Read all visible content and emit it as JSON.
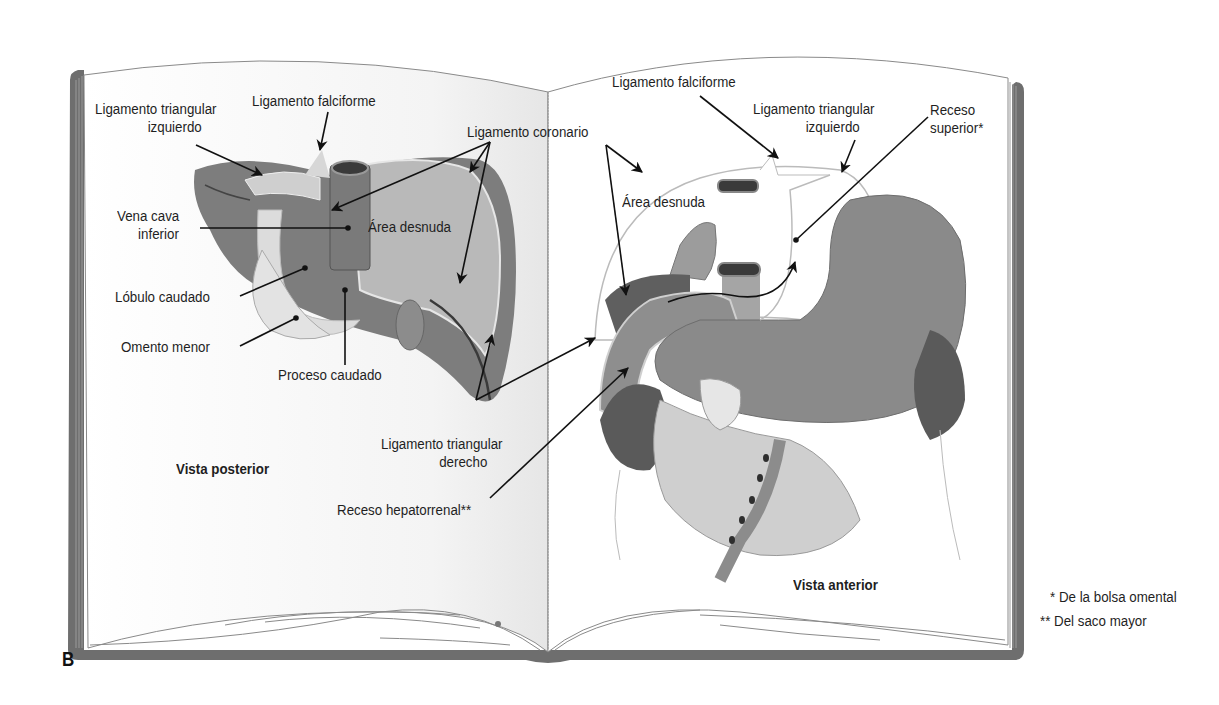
{
  "figure": {
    "panel_letter": "B",
    "left_page": {
      "view_title": "Vista posterior",
      "labels": {
        "ligamento_triangular_izquierdo_1": "Ligamento triangular",
        "ligamento_triangular_izquierdo_2": "izquierdo",
        "ligamento_falciforme": "Ligamento falciforme",
        "ligamento_coronario": "Ligamento coronario",
        "vena_cava_1": "Vena cava",
        "vena_cava_2": "inferior",
        "area_desnuda": "Área desnuda",
        "lobulo_caudado": "Lóbulo caudado",
        "omento_menor": "Omento menor",
        "proceso_caudado": "Proceso caudado",
        "ligamento_triangular_derecho_1": "Ligamento triangular",
        "ligamento_triangular_derecho_2": "derecho"
      }
    },
    "right_page": {
      "view_title": "Vista anterior",
      "labels": {
        "ligamento_falciforme": "Ligamento falciforme",
        "ligamento_triangular_izquierdo_1": "Ligamento triangular",
        "ligamento_triangular_izquierdo_2": "izquierdo",
        "receso_superior_1": "Receso",
        "receso_superior_2": "superior*",
        "area_desnuda": "Área desnuda",
        "receso_hepatorrenal": "Receso hepatorrenal**"
      }
    },
    "footnotes": [
      "* De la bolsa omental",
      "** Del saco mayor"
    ],
    "colors": {
      "liver_dark": "#7d7d7d",
      "liver_mid": "#9a9a9a",
      "bare_area": "#b9b9b9",
      "omentum": "#dcdcdc",
      "organ_dark": "#5f5f5f",
      "book_cover": "#6b6b6b",
      "page": "#ffffff",
      "line": "#111111"
    }
  }
}
